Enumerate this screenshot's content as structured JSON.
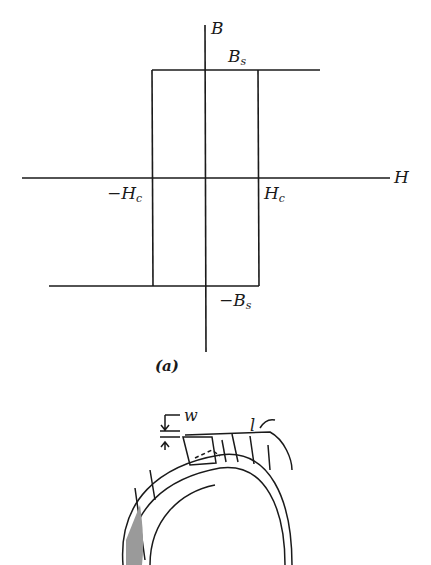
{
  "figure": {
    "panel_a": {
      "caption": "(a)",
      "axis_labels": {
        "vertical": "B",
        "horizontal": "H"
      },
      "labels": {
        "bs_main": "B",
        "bs_sub": "s",
        "neg_bs_main": "−B",
        "neg_bs_sub": "s",
        "hc_main": "H",
        "hc_sub": "c",
        "neg_hc_main": "−H",
        "neg_hc_sub": "c"
      },
      "description": "Square hysteresis loop of B vs H"
    },
    "panel_b": {
      "labels": {
        "width": "w",
        "length": "l"
      },
      "description": "Tape-wound toroidal core"
    },
    "colors": {
      "ink": "#1a1a1a",
      "background": "#ffffff"
    }
  }
}
